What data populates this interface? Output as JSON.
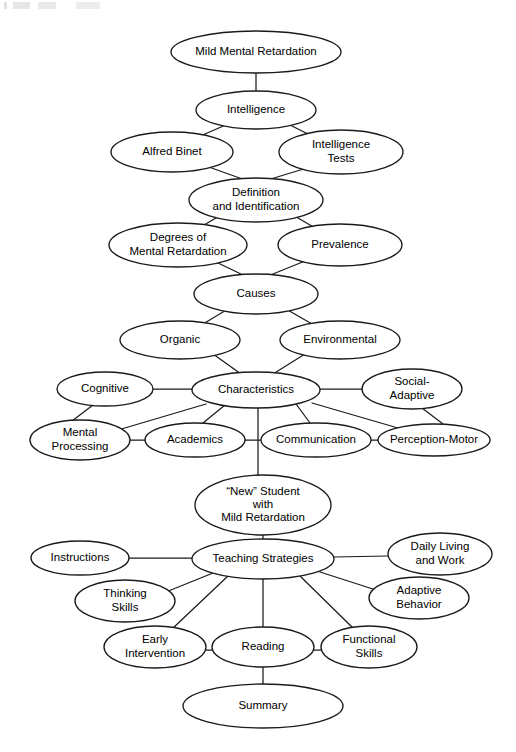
{
  "figure": {
    "type": "concept-map",
    "background_color": "#ffffff",
    "line_color": "#1a1a1a",
    "text_color": "#000000"
  },
  "nodes": [
    {
      "id": "mild-mental-retardation",
      "lines": [
        "Mild Mental Retardation"
      ],
      "cx": 256,
      "cy": 52,
      "rx": 85,
      "ry": 21,
      "font_size": 11.5
    },
    {
      "id": "intelligence",
      "lines": [
        "Intelligence"
      ],
      "cx": 256,
      "cy": 110,
      "rx": 60,
      "ry": 19,
      "font_size": 11.5
    },
    {
      "id": "alfred-binet",
      "lines": [
        "Alfred Binet"
      ],
      "cx": 172,
      "cy": 152,
      "rx": 61,
      "ry": 20,
      "font_size": 11.5
    },
    {
      "id": "intelligence-tests",
      "lines": [
        "Intelligence",
        "Tests"
      ],
      "cx": 341,
      "cy": 152,
      "rx": 62,
      "ry": 22,
      "font_size": 11.5
    },
    {
      "id": "definition-identification",
      "lines": [
        "Definition",
        "and Identification"
      ],
      "cx": 256,
      "cy": 200,
      "rx": 67,
      "ry": 22,
      "font_size": 11.5
    },
    {
      "id": "degrees-of-mental-retardation",
      "lines": [
        "Degrees of",
        "Mental Retardation"
      ],
      "cx": 178,
      "cy": 245,
      "rx": 69,
      "ry": 22,
      "font_size": 11.5
    },
    {
      "id": "prevalence",
      "lines": [
        "Prevalence"
      ],
      "cx": 340,
      "cy": 245,
      "rx": 62,
      "ry": 21,
      "font_size": 11.5
    },
    {
      "id": "causes",
      "lines": [
        "Causes"
      ],
      "cx": 256,
      "cy": 294,
      "rx": 62,
      "ry": 20,
      "font_size": 11.5
    },
    {
      "id": "organic",
      "lines": [
        "Organic"
      ],
      "cx": 180,
      "cy": 340,
      "rx": 60,
      "ry": 19,
      "font_size": 11.5
    },
    {
      "id": "environmental",
      "lines": [
        "Environmental"
      ],
      "cx": 340,
      "cy": 340,
      "rx": 60,
      "ry": 19,
      "font_size": 11.5
    },
    {
      "id": "characteristics",
      "lines": [
        "Characteristics"
      ],
      "cx": 256,
      "cy": 390,
      "rx": 64,
      "ry": 18,
      "font_size": 11.5
    },
    {
      "id": "cognitive",
      "lines": [
        "Cognitive"
      ],
      "cx": 105,
      "cy": 389,
      "rx": 48,
      "ry": 17,
      "font_size": 11.5
    },
    {
      "id": "social-adaptive",
      "lines": [
        "Social-",
        "Adaptive"
      ],
      "cx": 412,
      "cy": 389,
      "rx": 50,
      "ry": 20,
      "font_size": 11.5
    },
    {
      "id": "mental-processing",
      "lines": [
        "Mental",
        "Processing"
      ],
      "cx": 80,
      "cy": 440,
      "rx": 50,
      "ry": 20,
      "font_size": 11.5
    },
    {
      "id": "academics",
      "lines": [
        "Academics"
      ],
      "cx": 195,
      "cy": 440,
      "rx": 50,
      "ry": 17,
      "font_size": 11.5
    },
    {
      "id": "communication",
      "lines": [
        "Communication"
      ],
      "cx": 316,
      "cy": 440,
      "rx": 55,
      "ry": 17,
      "font_size": 11.5
    },
    {
      "id": "perception-motor",
      "lines": [
        "Perception-Motor"
      ],
      "cx": 434,
      "cy": 440,
      "rx": 56,
      "ry": 16,
      "font_size": 11.5
    },
    {
      "id": "new-student",
      "lines": [
        "“New” Student",
        "with",
        "Mild Retardation"
      ],
      "cx": 263,
      "cy": 505,
      "rx": 68,
      "ry": 30,
      "font_size": 11.5
    },
    {
      "id": "teaching-strategies",
      "lines": [
        "Teaching Strategies"
      ],
      "cx": 263,
      "cy": 559,
      "rx": 71,
      "ry": 20,
      "font_size": 11.5
    },
    {
      "id": "instructions",
      "lines": [
        "Instructions"
      ],
      "cx": 80,
      "cy": 558,
      "rx": 49,
      "ry": 17,
      "font_size": 11.5
    },
    {
      "id": "daily-living-and-work",
      "lines": [
        "Daily Living",
        "and Work"
      ],
      "cx": 440,
      "cy": 554,
      "rx": 52,
      "ry": 21,
      "font_size": 11.5
    },
    {
      "id": "thinking-skills",
      "lines": [
        "Thinking",
        "Skills"
      ],
      "cx": 125,
      "cy": 601,
      "rx": 50,
      "ry": 21,
      "font_size": 11.5
    },
    {
      "id": "adaptive-behavior",
      "lines": [
        "Adaptive",
        "Behavior"
      ],
      "cx": 419,
      "cy": 598,
      "rx": 50,
      "ry": 21,
      "font_size": 11.5
    },
    {
      "id": "early-intervention",
      "lines": [
        "Early",
        "Intervention"
      ],
      "cx": 155,
      "cy": 647,
      "rx": 51,
      "ry": 21,
      "font_size": 11.5
    },
    {
      "id": "reading",
      "lines": [
        "Reading"
      ],
      "cx": 263,
      "cy": 647,
      "rx": 51,
      "ry": 20,
      "font_size": 11.5
    },
    {
      "id": "functional-skills",
      "lines": [
        "Functional",
        "Skills"
      ],
      "cx": 369,
      "cy": 647,
      "rx": 48,
      "ry": 21,
      "font_size": 11.5
    },
    {
      "id": "summary",
      "lines": [
        "Summary"
      ],
      "cx": 263,
      "cy": 706,
      "rx": 80,
      "ry": 22,
      "font_size": 11.5
    }
  ],
  "edges": [
    {
      "from": "mild-mental-retardation",
      "to": "intelligence",
      "x1": 256,
      "y1": 73,
      "x2": 256,
      "y2": 91
    },
    {
      "from": "intelligence",
      "to": "alfred-binet",
      "x1": 228,
      "y1": 124,
      "x2": 198,
      "y2": 137
    },
    {
      "from": "intelligence",
      "to": "intelligence-tests",
      "x1": 288,
      "y1": 124,
      "x2": 314,
      "y2": 137
    },
    {
      "from": "alfred-binet",
      "to": "definition-identification",
      "x1": 206,
      "y1": 166,
      "x2": 248,
      "y2": 181
    },
    {
      "from": "intelligence-tests",
      "to": "definition-identification",
      "x1": 307,
      "y1": 168,
      "x2": 264,
      "y2": 181
    },
    {
      "from": "definition-identification",
      "to": "degrees-of-mental-retardation",
      "x1": 221,
      "y1": 215,
      "x2": 199,
      "y2": 228
    },
    {
      "from": "definition-identification",
      "to": "prevalence",
      "x1": 293,
      "y1": 215,
      "x2": 315,
      "y2": 228
    },
    {
      "from": "degrees-of-mental-retardation",
      "to": "causes",
      "x1": 214,
      "y1": 261,
      "x2": 245,
      "y2": 276
    },
    {
      "from": "prevalence",
      "to": "causes",
      "x1": 305,
      "y1": 261,
      "x2": 268,
      "y2": 276
    },
    {
      "from": "causes",
      "to": "organic",
      "x1": 228,
      "y1": 309,
      "x2": 203,
      "y2": 324
    },
    {
      "from": "causes",
      "to": "environmental",
      "x1": 286,
      "y1": 309,
      "x2": 312,
      "y2": 324
    },
    {
      "from": "organic",
      "to": "characteristics",
      "x1": 213,
      "y1": 354,
      "x2": 241,
      "y2": 374
    },
    {
      "from": "environmental",
      "to": "characteristics",
      "x1": 305,
      "y1": 354,
      "x2": 273,
      "y2": 374
    },
    {
      "from": "cognitive",
      "to": "characteristics",
      "x1": 153,
      "y1": 389,
      "x2": 192,
      "y2": 389
    },
    {
      "from": "characteristics",
      "to": "social-adaptive",
      "x1": 320,
      "y1": 389,
      "x2": 362,
      "y2": 389
    },
    {
      "from": "cognitive",
      "to": "mental-processing",
      "x1": 93,
      "y1": 405,
      "x2": 72,
      "y2": 421
    },
    {
      "from": "characteristics",
      "to": "mental-processing",
      "x1": 206,
      "y1": 404,
      "x2": 118,
      "y2": 430
    },
    {
      "from": "characteristics",
      "to": "academics",
      "x1": 225,
      "y1": 405,
      "x2": 203,
      "y2": 423
    },
    {
      "from": "characteristics",
      "to": "communication",
      "x1": 296,
      "y1": 404,
      "x2": 310,
      "y2": 423
    },
    {
      "from": "characteristics",
      "to": "perception-motor",
      "x1": 312,
      "y1": 403,
      "x2": 398,
      "y2": 428
    },
    {
      "from": "social-adaptive",
      "to": "perception-motor",
      "x1": 422,
      "y1": 408,
      "x2": 443,
      "y2": 424
    },
    {
      "from": "mental-processing",
      "to": "academics",
      "x1": 130,
      "y1": 440,
      "x2": 145,
      "y2": 440
    },
    {
      "from": "academics",
      "to": "communication",
      "x1": 245,
      "y1": 440,
      "x2": 261,
      "y2": 440
    },
    {
      "from": "communication",
      "to": "perception-motor",
      "x1": 371,
      "y1": 440,
      "x2": 378,
      "y2": 440
    },
    {
      "from": "characteristics",
      "to": "new-student",
      "x1": 258,
      "y1": 408,
      "x2": 258,
      "y2": 476
    },
    {
      "from": "new-student",
      "to": "teaching-strategies",
      "x1": 263,
      "y1": 535,
      "x2": 263,
      "y2": 540
    },
    {
      "from": "instructions",
      "to": "teaching-strategies",
      "x1": 129,
      "y1": 558,
      "x2": 192,
      "y2": 558
    },
    {
      "from": "teaching-strategies",
      "to": "daily-living-and-work",
      "x1": 334,
      "y1": 557,
      "x2": 388,
      "y2": 556
    },
    {
      "from": "teaching-strategies",
      "to": "thinking-skills",
      "x1": 213,
      "y1": 573,
      "x2": 166,
      "y2": 592
    },
    {
      "from": "teaching-strategies",
      "to": "adaptive-behavior",
      "x1": 320,
      "y1": 572,
      "x2": 376,
      "y2": 590
    },
    {
      "from": "teaching-strategies",
      "to": "early-intervention",
      "x1": 228,
      "y1": 576,
      "x2": 172,
      "y2": 629
    },
    {
      "from": "teaching-strategies",
      "to": "reading",
      "x1": 263,
      "y1": 579,
      "x2": 263,
      "y2": 627
    },
    {
      "from": "teaching-strategies",
      "to": "functional-skills",
      "x1": 300,
      "y1": 576,
      "x2": 354,
      "y2": 629
    },
    {
      "from": "early-intervention",
      "to": "reading",
      "x1": 205,
      "y1": 650,
      "x2": 213,
      "y2": 650
    },
    {
      "from": "reading",
      "to": "functional-skills",
      "x1": 313,
      "y1": 650,
      "x2": 322,
      "y2": 650
    },
    {
      "from": "reading",
      "to": "summary",
      "x1": 263,
      "y1": 667,
      "x2": 263,
      "y2": 684
    }
  ]
}
